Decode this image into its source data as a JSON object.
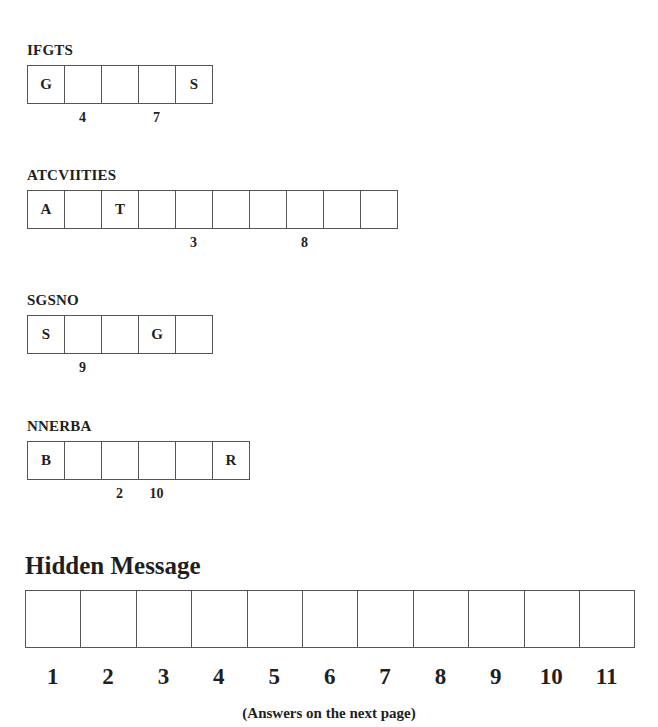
{
  "puzzles": [
    {
      "scrambled": "IFGTS",
      "cells": [
        "G",
        "",
        "",
        "",
        "S"
      ],
      "numbers": [
        "",
        "4",
        "",
        "7",
        ""
      ]
    },
    {
      "scrambled": "ATCVIITIES",
      "cells": [
        "A",
        "",
        "T",
        "",
        "",
        "",
        "",
        "",
        "",
        ""
      ],
      "numbers": [
        "",
        "",
        "",
        "",
        "3",
        "",
        "",
        "8",
        "",
        ""
      ]
    },
    {
      "scrambled": "SGSNO",
      "cells": [
        "S",
        "",
        "",
        "G",
        ""
      ],
      "numbers": [
        "",
        "9",
        "",
        "",
        ""
      ]
    },
    {
      "scrambled": "NNERBA",
      "cells": [
        "B",
        "",
        "",
        "",
        "",
        "R"
      ],
      "numbers": [
        "",
        "",
        "2",
        "10",
        "",
        ""
      ]
    }
  ],
  "hidden_message": {
    "title": "Hidden Message",
    "cells": [
      "",
      "",
      "",
      "",
      "",
      "",
      "",
      "",
      "",
      "",
      ""
    ],
    "numbers": [
      "1",
      "2",
      "3",
      "4",
      "5",
      "6",
      "7",
      "8",
      "9",
      "10",
      "11"
    ]
  },
  "footer": "(Answers on the next page)"
}
